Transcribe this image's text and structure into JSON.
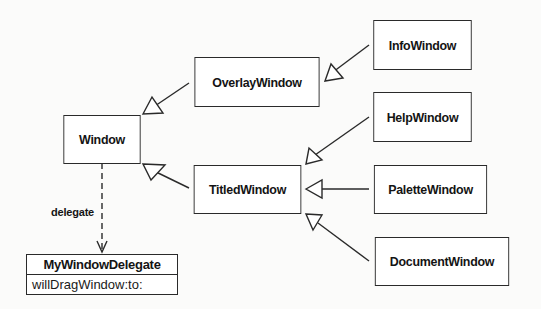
{
  "diagram": {
    "type": "UML class diagram",
    "classes": {
      "window": "Window",
      "overlay": "OverlayWindow",
      "titled": "TitledWindow",
      "info": "InfoWindow",
      "help": "HelpWindow",
      "palette": "PaletteWindow",
      "document": "DocumentWindow"
    },
    "delegate_class": {
      "name": "MyWindowDelegate",
      "method": "willDragWindow:to:"
    },
    "association_label": "delegate",
    "relationships": [
      {
        "from": "OverlayWindow",
        "to": "Window",
        "kind": "inheritance"
      },
      {
        "from": "TitledWindow",
        "to": "Window",
        "kind": "inheritance"
      },
      {
        "from": "InfoWindow",
        "to": "OverlayWindow",
        "kind": "inheritance"
      },
      {
        "from": "HelpWindow",
        "to": "TitledWindow",
        "kind": "inheritance"
      },
      {
        "from": "PaletteWindow",
        "to": "TitledWindow",
        "kind": "inheritance"
      },
      {
        "from": "DocumentWindow",
        "to": "TitledWindow",
        "kind": "inheritance"
      },
      {
        "from": "Window",
        "to": "MyWindowDelegate",
        "kind": "delegate (dashed)"
      }
    ],
    "colors": {
      "line": "#2a2a2a",
      "background": "#fbfbfa",
      "box": "#ffffff"
    }
  }
}
